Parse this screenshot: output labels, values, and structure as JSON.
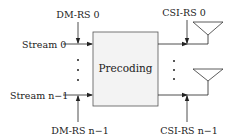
{
  "diagram": {
    "block": {
      "label": "Precoding",
      "fill": "#f3f3f3",
      "stroke": "#555555"
    },
    "inputs": [
      {
        "label": "Stream 0",
        "reference_signal": "DM-RS 0"
      },
      {
        "label": "Stream n−1",
        "reference_signal": "DM-RS n−1"
      }
    ],
    "outputs": [
      {
        "reference_signal": "CSI-RS 0",
        "antenna": "antenna-0"
      },
      {
        "reference_signal": "CSI-RS n−1",
        "antenna": "antenna-n-1"
      }
    ],
    "ellipsis": "⋮"
  }
}
